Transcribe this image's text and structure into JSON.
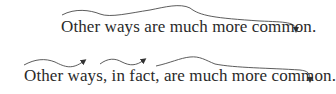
{
  "examples": [
    {
      "id": "example-1",
      "sentence": "Other ways are much more common.",
      "arcs": 1
    },
    {
      "id": "example-2",
      "sentence": "Other ways, in fact, are much more common.",
      "arcs": 3
    }
  ],
  "colors": {
    "text": "#2a2a2a",
    "arc": "#4a4a4a"
  }
}
